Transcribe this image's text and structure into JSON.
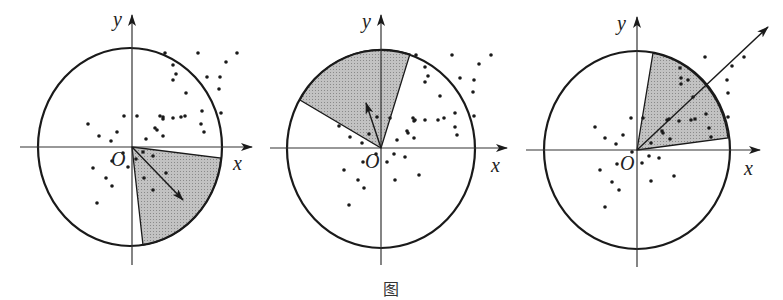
{
  "figure": {
    "caption": "图",
    "panels": [
      {
        "id": "panel-1",
        "origin": [
          132,
          147
        ],
        "circle": {
          "cx": 130,
          "cy": 147,
          "rx": 92,
          "ry": 99
        },
        "x_axis": {
          "from": 20,
          "to": 252,
          "label": "x",
          "label_pos": [
            233,
            170
          ]
        },
        "y_axis": {
          "from": 265,
          "to": 15,
          "label": "y",
          "label_pos": [
            113,
            26
          ]
        },
        "origin_label": "O",
        "origin_label_pos": [
          111,
          166
        ],
        "sector": {
          "p1": [
            221,
            158
          ],
          "p2": [
            143,
            245
          ],
          "sweep": 1
        },
        "arrow": {
          "to": [
            183,
            200
          ]
        },
        "points": [
          [
            165,
            53
          ],
          [
            198,
            53
          ],
          [
            237,
            53
          ],
          [
            226,
            62
          ],
          [
            173,
            65
          ],
          [
            176,
            74
          ],
          [
            173,
            80
          ],
          [
            207,
            77
          ],
          [
            220,
            77
          ],
          [
            219,
            89
          ],
          [
            186,
            93
          ],
          [
            202,
            111
          ],
          [
            221,
            113
          ],
          [
            124,
            116
          ],
          [
            137,
            116
          ],
          [
            160,
            116
          ],
          [
            163,
            117
          ],
          [
            163,
            119
          ],
          [
            173,
            118
          ],
          [
            181,
            117
          ],
          [
            185,
            116
          ],
          [
            88,
            124
          ],
          [
            201,
            124
          ],
          [
            204,
            132
          ],
          [
            155,
            128
          ],
          [
            157,
            130
          ],
          [
            163,
            136
          ],
          [
            99,
            136
          ],
          [
            117,
            132
          ],
          [
            111,
            141
          ],
          [
            146,
            139
          ],
          [
            143,
            152
          ],
          [
            153,
            156
          ],
          [
            123,
            153
          ],
          [
            112,
            161
          ],
          [
            128,
            167
          ],
          [
            136,
            159
          ],
          [
            166,
            173
          ],
          [
            93,
            168
          ],
          [
            106,
            178
          ],
          [
            144,
            178
          ],
          [
            112,
            186
          ],
          [
            153,
            190
          ],
          [
            97,
            203
          ]
        ]
      },
      {
        "id": "panel-2",
        "origin": [
          381,
          148
        ],
        "circle": {
          "cx": 381,
          "cy": 149,
          "rx": 94,
          "ry": 99
        },
        "x_axis": {
          "from": 270,
          "to": 507,
          "label": "x",
          "label_pos": [
            491,
            172
          ]
        },
        "y_axis": {
          "from": 265,
          "to": 15,
          "label": "y",
          "label_pos": [
            362,
            28
          ]
        },
        "origin_label": "O",
        "origin_label_pos": [
          365,
          168
        ],
        "sector": {
          "p1": [
            410,
            54
          ],
          "p2": [
            300,
            100
          ],
          "sweep": 0
        },
        "arrow": {
          "to": [
            366,
            103
          ]
        },
        "points": [
          [
            416,
            55
          ],
          [
            452,
            55
          ],
          [
            491,
            55
          ],
          [
            479,
            64
          ],
          [
            425,
            67
          ],
          [
            428,
            76
          ],
          [
            425,
            82
          ],
          [
            460,
            78
          ],
          [
            474,
            80
          ],
          [
            473,
            92
          ],
          [
            440,
            96
          ],
          [
            455,
            113
          ],
          [
            474,
            116
          ],
          [
            377,
            117
          ],
          [
            390,
            118
          ],
          [
            413,
            118
          ],
          [
            415,
            120
          ],
          [
            414,
            121
          ],
          [
            425,
            120
          ],
          [
            438,
            120
          ],
          [
            444,
            118
          ],
          [
            339,
            126
          ],
          [
            455,
            127
          ],
          [
            457,
            135
          ],
          [
            407,
            131
          ],
          [
            408,
            133
          ],
          [
            414,
            138
          ],
          [
            350,
            137
          ],
          [
            369,
            134
          ],
          [
            362,
            143
          ],
          [
            397,
            140
          ],
          [
            394,
            154
          ],
          [
            405,
            157
          ],
          [
            376,
            154
          ],
          [
            363,
            162
          ],
          [
            387,
            162
          ],
          [
            419,
            175
          ],
          [
            344,
            170
          ],
          [
            358,
            180
          ],
          [
            395,
            180
          ],
          [
            364,
            188
          ],
          [
            349,
            205
          ]
        ]
      },
      {
        "id": "panel-3",
        "origin": [
          637,
          150
        ],
        "circle": {
          "cx": 637,
          "cy": 150,
          "rx": 93,
          "ry": 99
        },
        "x_axis": {
          "from": 526,
          "to": 760,
          "label": "x",
          "label_pos": [
            744,
            175
          ]
        },
        "y_axis": {
          "from": 267,
          "to": 17,
          "label": "y",
          "label_pos": [
            617,
            30
          ]
        },
        "origin_label": "O",
        "origin_label_pos": [
          620,
          170
        ],
        "sector": {
          "p1": [
            728,
            138
          ],
          "p2": [
            653,
            53
          ],
          "sweep": 0
        },
        "arrow": {
          "to": [
            768,
            27
          ]
        },
        "points": [
          [
            705,
            57
          ],
          [
            744,
            57
          ],
          [
            680,
            68
          ],
          [
            732,
            66
          ],
          [
            681,
            78
          ],
          [
            688,
            80
          ],
          [
            681,
            84
          ],
          [
            727,
            80
          ],
          [
            728,
            93
          ],
          [
            693,
            97
          ],
          [
            706,
            114
          ],
          [
            728,
            117
          ],
          [
            631,
            118
          ],
          [
            643,
            118
          ],
          [
            667,
            120
          ],
          [
            669,
            119
          ],
          [
            679,
            121
          ],
          [
            691,
            120
          ],
          [
            695,
            119
          ],
          [
            595,
            127
          ],
          [
            709,
            128
          ],
          [
            711,
            137
          ],
          [
            662,
            131
          ],
          [
            663,
            133
          ],
          [
            670,
            139
          ],
          [
            605,
            138
          ],
          [
            623,
            135
          ],
          [
            616,
            144
          ],
          [
            651,
            143
          ],
          [
            632,
            152
          ],
          [
            649,
            156
          ],
          [
            659,
            158
          ],
          [
            617,
            164
          ],
          [
            642,
            163
          ],
          [
            674,
            176
          ],
          [
            600,
            170
          ],
          [
            612,
            182
          ],
          [
            651,
            181
          ],
          [
            619,
            190
          ],
          [
            605,
            207
          ]
        ]
      }
    ],
    "colors": {
      "stroke": "#1a1a1a",
      "sector_fill": "#b4b4b4",
      "point": "#1a1a1a",
      "axis": "#333333"
    }
  }
}
